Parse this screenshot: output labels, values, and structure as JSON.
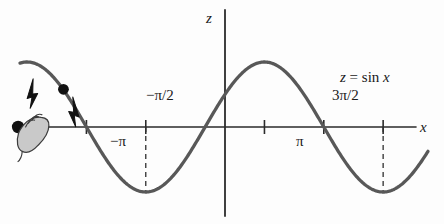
{
  "figure": {
    "kind": "math-plot",
    "background_color": "#fdfdfd",
    "ink_color": "#3a3a3a",
    "axis_color": "#2b2b2b",
    "curve_color": "#585858",
    "marker_color": "#111111",
    "hand_fill": "#c9c9c9",
    "hand_stroke": "#3c3c3c"
  },
  "labels": {
    "z_axis": "z",
    "x_axis": "x",
    "equation_lhs": "z",
    "equation_eq": "=",
    "equation_rhs_fn": "sin",
    "equation_rhs_var": "x",
    "equation_full": "z = sin x",
    "tick_neg_pi": "−π",
    "tick_neg_pi_over_2": "−π/2",
    "tick_pi": "π",
    "tick_3pi_over_2": "3π/2"
  },
  "chart_data": {
    "type": "line",
    "title": "",
    "subtitle": "",
    "xlabel": "x",
    "ylabel": "z",
    "annotations": [
      {
        "text": "z = sin x",
        "x": 3.9,
        "y": 1.25,
        "name": "curve-equation"
      },
      {
        "text": "−π",
        "x": -3.1416,
        "y": -0.32,
        "name": "tick-label-neg-pi"
      },
      {
        "text": "−π/2",
        "x": -1.5708,
        "y": 0.45,
        "name": "tick-label-neg-pi-over-2"
      },
      {
        "text": "π",
        "x": 3.1416,
        "y": -0.32,
        "name": "tick-label-pi"
      },
      {
        "text": "3π/2",
        "x": 4.7124,
        "y": 0.45,
        "name": "tick-label-3pi-over-2"
      }
    ],
    "grid": false,
    "legend": "none",
    "xlim": [
      -4.9,
      5.9
    ],
    "ylim": [
      -1.45,
      1.45
    ],
    "x_ticks": [
      -3.1416,
      -1.5708,
      1.5708,
      3.1416,
      4.7124
    ],
    "x_tick_labels": [
      "−π",
      "",
      "",
      "π",
      ""
    ],
    "series": [
      {
        "name": "z = sin x",
        "expression": "sin(x)",
        "x": [
          -4.9,
          -4.6,
          -4.3,
          -4.0,
          -3.7,
          -3.4,
          -3.1416,
          -2.8,
          -2.5,
          -2.2,
          -1.9,
          -1.5708,
          -1.25,
          -0.95,
          -0.6,
          -0.3,
          0.0,
          0.3,
          0.6,
          0.95,
          1.25,
          1.5708,
          1.9,
          2.2,
          2.5,
          2.8,
          3.1416,
          3.5,
          3.9,
          4.3,
          4.7124,
          5.1,
          5.5,
          5.9
        ],
        "y": [
          0.982,
          0.994,
          0.917,
          0.757,
          0.53,
          0.256,
          0.0,
          -0.335,
          -0.598,
          -0.808,
          -0.946,
          -1.0,
          -0.949,
          -0.813,
          -0.565,
          -0.296,
          0.0,
          0.296,
          0.565,
          0.813,
          0.949,
          1.0,
          0.946,
          0.808,
          0.598,
          0.335,
          0.0,
          -0.351,
          -0.688,
          -0.916,
          -1.0,
          -0.926,
          -0.706,
          -0.374
        ]
      }
    ],
    "markers": [
      {
        "name": "grabbed-point",
        "x": -4.95,
        "y": 0.0,
        "style": "filled-dot",
        "note": "point on x-axis held by hand cursor"
      },
      {
        "name": "traveling-point",
        "x": -3.75,
        "y": 0.58,
        "style": "filled-dot",
        "note": "point on descending branch"
      }
    ],
    "arrows": [
      {
        "name": "arrow-up-left",
        "x": -4.62,
        "y": 0.52,
        "direction": "up-right",
        "note": "motion arrow on rising branch"
      },
      {
        "name": "arrow-down-left",
        "x": -3.45,
        "y": 0.24,
        "direction": "down-right",
        "note": "motion arrow on descending branch"
      }
    ],
    "dashed_drop_lines": [
      {
        "name": "dashed-line-neg-pi-over-2",
        "x": -1.5708,
        "y_from": 0.0,
        "y_to": -1.0
      },
      {
        "name": "dashed-line-3pi-over-2",
        "x": 4.7124,
        "y_from": 0.0,
        "y_to": -1.0
      }
    ],
    "cursor": {
      "name": "hand-cursor",
      "x": -5.1,
      "y": -0.22,
      "kind": "grabbing-hand"
    }
  }
}
